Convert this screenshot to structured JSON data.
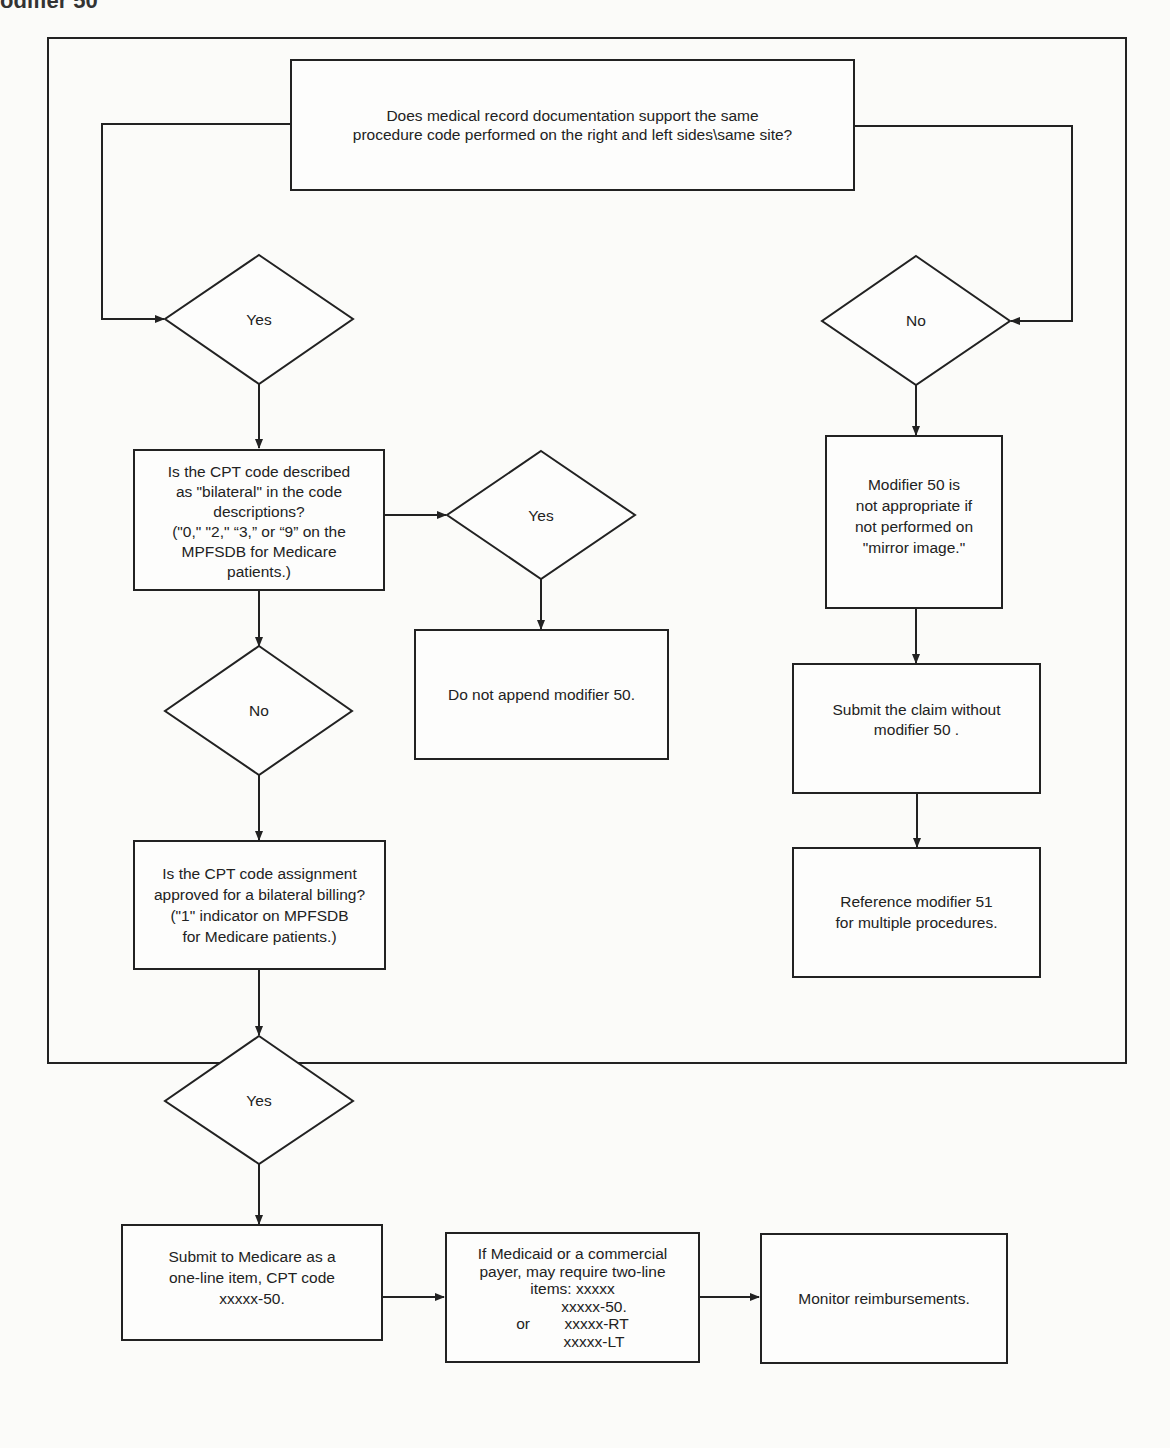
{
  "page": {
    "heading_partial": "odifier 50"
  },
  "flowchart": {
    "start": {
      "text": "Does medical record documentation support the same\nprocedure code performed on the right and left sides\\same site?"
    },
    "decisions": {
      "start_yes": "Yes",
      "start_no": "No",
      "bilateral_yes": "Yes",
      "bilateral_no": "No",
      "approved_yes": "Yes"
    },
    "boxes": {
      "bilateral_question": "Is the CPT code described\nas \"bilateral\" in the code\ndescriptions?\n(\"0,\" \"2,\" “3,” or “9” on the\nMPFSDB for Medicare\npatients.)",
      "do_not_append": "Do not append modifier 50.",
      "approved_question": "Is the CPT code assignment\napproved for a bilateral billing?\n(\"1\" indicator on MPFSDB\nfor Medicare patients.)",
      "submit_medicare": "Submit to Medicare as a\none-line item, CPT code\nxxxxx-50.",
      "medicaid_commercial": "If Medicaid or a commercial\npayer, may require two-line\nitems: xxxxx\n          xxxxx-50.\nor        xxxxx-RT\n          xxxxx-LT",
      "monitor": "Monitor reimbursements.",
      "mirror_image": "Modifier 50 is\nnot appropriate if\nnot performed on\n\"mirror image.\"",
      "submit_without": "Submit the claim without\nmodifier 50 .",
      "reference_51": "Reference modifier 51\nfor multiple procedures."
    }
  }
}
